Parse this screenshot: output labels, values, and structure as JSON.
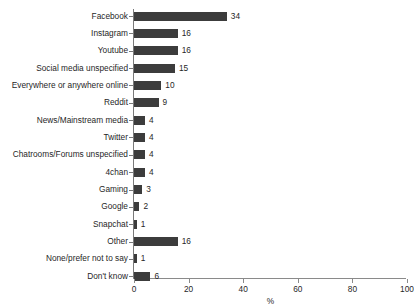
{
  "chart_data": {
    "type": "bar",
    "orientation": "horizontal",
    "title": "",
    "subtitle": "",
    "xlabel": "%",
    "ylabel": "",
    "xlim": [
      0,
      100
    ],
    "xticks": [
      0,
      20,
      40,
      60,
      80,
      100
    ],
    "xtick_labels": [
      "0",
      "20",
      "40",
      "60",
      "80",
      "100"
    ],
    "grid": false,
    "legend": false,
    "bar_color": "#3c3c3c",
    "categories": [
      "Facebook",
      "Instagram",
      "Youtube",
      "Social media unspecified",
      "Everywhere or anywhere online",
      "Reddit",
      "News/Mainstream media",
      "Twitter",
      "Chatrooms/Forums unspecified",
      "4chan",
      "Gaming",
      "Google",
      "Snapchat",
      "Other",
      "None/prefer not to say",
      "Don't know"
    ],
    "values": [
      34,
      16,
      16,
      15,
      10,
      9,
      4,
      4,
      4,
      4,
      3,
      2,
      1,
      16,
      1,
      6
    ],
    "value_labels": [
      "34",
      "16",
      "16",
      "15",
      "10",
      "9",
      "4",
      "4",
      "4",
      "4",
      "3",
      "2",
      "1",
      "16",
      "1",
      "6"
    ]
  }
}
